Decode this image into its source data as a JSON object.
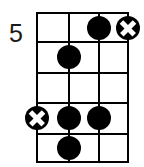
{
  "diagram": {
    "kind": "guitar-chord-diagram",
    "position_label": "5",
    "string_count": 4,
    "fret_count": 5,
    "colors": {
      "ink": "#000000",
      "background": "#ffffff",
      "label": "#1a1a1a"
    },
    "geometry": {
      "grid_left": 37,
      "grid_right": 128,
      "grid_top": 13,
      "grid_bottom": 162,
      "string_x": [
        37,
        69,
        99,
        128
      ],
      "fret_y": [
        13,
        42,
        73,
        103,
        134,
        162
      ]
    },
    "markers": [
      {
        "name": "marker-string3-fret1-filled",
        "type": "filled",
        "string": 3,
        "fret": 1,
        "x": 99,
        "y": 28
      },
      {
        "name": "marker-string4-fret1-cross",
        "type": "cross",
        "string": 4,
        "fret": 1,
        "x": 128,
        "y": 28
      },
      {
        "name": "marker-string2-fret2-filled",
        "type": "filled",
        "string": 2,
        "fret": 2,
        "x": 69,
        "y": 57
      },
      {
        "name": "marker-string1-fret4-cross",
        "type": "cross",
        "string": 1,
        "fret": 4,
        "x": 37,
        "y": 118
      },
      {
        "name": "marker-string2-fret4-filled",
        "type": "filled",
        "string": 2,
        "fret": 4,
        "x": 69,
        "y": 118
      },
      {
        "name": "marker-string3-fret4-filled",
        "type": "filled",
        "string": 3,
        "fret": 4,
        "x": 99,
        "y": 118
      },
      {
        "name": "marker-string2-fret5-filled",
        "type": "filled",
        "string": 2,
        "fret": 5,
        "x": 69,
        "y": 148
      }
    ]
  }
}
